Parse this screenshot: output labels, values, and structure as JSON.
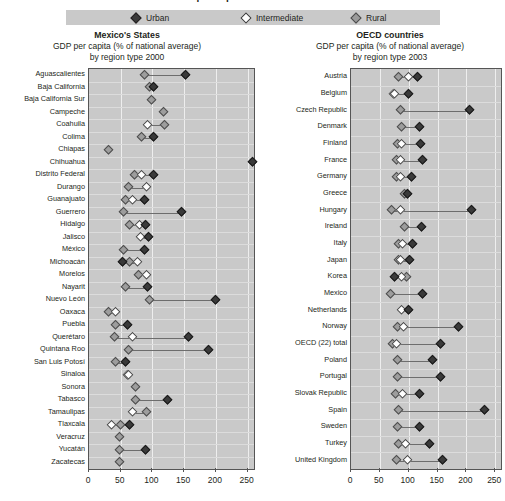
{
  "title": "GDP per capita in Mexico's States",
  "legend": {
    "urban": {
      "label": "Urban",
      "icon": "filled-diamond-icon",
      "color": "#3b3b3b"
    },
    "intermediate": {
      "label": "Intermediate",
      "icon": "open-diamond-icon",
      "color": "#ffffff"
    },
    "rural": {
      "label": "Rural",
      "icon": "grey-diamond-icon",
      "color": "#9a9a9a"
    }
  },
  "panels": {
    "left": {
      "title": "Mexico's States",
      "subtitle1": "GDP per capita (% of national average)",
      "subtitle2": "by region type 2000"
    },
    "right": {
      "title": "OECD countries",
      "subtitle1": "GDP per capita (% of national average)",
      "subtitle2": "by region type 2003"
    }
  },
  "chart_data": [
    {
      "type": "scatter",
      "title": "Mexico's States",
      "subtitle": "GDP per capita (% of national average) by region type 2000",
      "xlabel": "",
      "ylabel": "",
      "xlim": [
        0,
        260
      ],
      "xticks": [
        0,
        50,
        100,
        150,
        200,
        250
      ],
      "xticklabels": [
        "0",
        "50",
        "100",
        "150",
        "200",
        "250"
      ],
      "grid": true,
      "legend_position": "top",
      "series_names": [
        "Urban",
        "Intermediate",
        "Rural"
      ],
      "categories": [
        "Aguascalientes",
        "Baja California",
        "Baja California Sur",
        "Campeche",
        "Coahuila",
        "Colima",
        "Chiapas",
        "Chihuahua",
        "Distrito Federal",
        "Durango",
        "Guanajuato",
        "Guerrero",
        "Hidalgo",
        "Jalisco",
        "México",
        "Michoacán",
        "Morelos",
        "Nayarit",
        "Nuevo León",
        "Oaxaca",
        "Puebla",
        "Querétaro",
        "Quintana Roo",
        "San Luis Potosí",
        "Sinaloa",
        "Sonora",
        "Tabasco",
        "Tamaulipas",
        "Tlaxcala",
        "Veracruz",
        "Yucatán",
        "Zacatecas"
      ],
      "points": [
        {
          "category": "Aguascalientes",
          "urban": 152,
          "intermediate": null,
          "rural": 88
        },
        {
          "category": "Baja California",
          "urban": 101,
          "intermediate": null,
          "rural": 96
        },
        {
          "category": "Baja California Sur",
          "urban": null,
          "intermediate": null,
          "rural": 98
        },
        {
          "category": "Campeche",
          "urban": null,
          "intermediate": null,
          "rural": 118
        },
        {
          "category": "Coahuila",
          "urban": null,
          "intermediate": 92,
          "rural": 119
        },
        {
          "category": "Colima",
          "urban": 101,
          "intermediate": null,
          "rural": 83
        },
        {
          "category": "Chiapas",
          "urban": null,
          "intermediate": null,
          "rural": 31
        },
        {
          "category": "Chihuahua",
          "urban": 258,
          "intermediate": null,
          "rural": null
        },
        {
          "category": "Distrito Federal",
          "urban": 101,
          "intermediate": 83,
          "rural": 72
        },
        {
          "category": "Durango",
          "urban": null,
          "intermediate": 90,
          "rural": 63
        },
        {
          "category": "Guanajuato",
          "urban": 88,
          "intermediate": 68,
          "rural": 57
        },
        {
          "category": "Guerrero",
          "urban": 146,
          "intermediate": null,
          "rural": 55
        },
        {
          "category": "Hidalgo",
          "urban": 89,
          "intermediate": 79,
          "rural": 64
        },
        {
          "category": "Jalisco",
          "urban": 94,
          "intermediate": 81,
          "rural": null
        },
        {
          "category": "México",
          "urban": 88,
          "intermediate": null,
          "rural": 55
        },
        {
          "category": "Michoacán",
          "urban": 52,
          "intermediate": 76,
          "rural": 64
        },
        {
          "category": "Morelos",
          "urban": null,
          "intermediate": 91,
          "rural": 78
        },
        {
          "category": "Nayarit",
          "urban": 92,
          "intermediate": null,
          "rural": 58
        },
        {
          "category": "Nuevo León",
          "urban": 199,
          "intermediate": null,
          "rural": 96
        },
        {
          "category": "Oaxaca",
          "urban": null,
          "intermediate": 41,
          "rural": 31
        },
        {
          "category": "Puebla",
          "urban": 61,
          "intermediate": null,
          "rural": 41
        },
        {
          "category": "Querétaro",
          "urban": 157,
          "intermediate": 69,
          "rural": 40
        },
        {
          "category": "Quintana Roo",
          "urban": 188,
          "intermediate": null,
          "rural": 62
        },
        {
          "category": "San Luis Potosí",
          "urban": 57,
          "intermediate": null,
          "rural": 41
        },
        {
          "category": "Sinaloa",
          "urban": null,
          "intermediate": 62,
          "rural": 60
        },
        {
          "category": "Sonora",
          "urban": null,
          "intermediate": null,
          "rural": 73
        },
        {
          "category": "Tabasco",
          "urban": 124,
          "intermediate": null,
          "rural": 73
        },
        {
          "category": "Tamaulipas",
          "urban": null,
          "intermediate": 69,
          "rural": 90
        },
        {
          "category": "Tlaxcala",
          "urban": 64,
          "intermediate": 36,
          "rural": 49
        },
        {
          "category": "Veracruz",
          "urban": null,
          "intermediate": null,
          "rural": 48
        },
        {
          "category": "Yucatán",
          "urban": 89,
          "intermediate": null,
          "rural": 48
        },
        {
          "category": "Zacatecas",
          "urban": null,
          "intermediate": null,
          "rural": 48
        }
      ]
    },
    {
      "type": "scatter",
      "title": "OECD countries",
      "subtitle": "GDP per capita (% of national average) by region type 2003",
      "xlabel": "",
      "ylabel": "",
      "xlim": [
        0,
        260
      ],
      "xticks": [
        0,
        50,
        100,
        150,
        200,
        250
      ],
      "xticklabels": [
        "0",
        "50",
        "100",
        "150",
        "200",
        "250"
      ],
      "grid": true,
      "legend_position": "top",
      "series_names": [
        "Urban",
        "Intermediate",
        "Rural"
      ],
      "categories": [
        "Austria",
        "Belgium",
        "Czech Republic",
        "Denmark",
        "Finland",
        "France",
        "Germany",
        "Greece",
        "Hungary",
        "Ireland",
        "Italy",
        "Japan",
        "Korea",
        "Mexico",
        "Netherlands",
        "Norway",
        "OECD (22) total",
        "Poland",
        "Portugal",
        "Slovak Republic",
        "Spain",
        "Sweden",
        "Turkey",
        "United Kingdom"
      ],
      "points": [
        {
          "category": "Austria",
          "urban": 115,
          "intermediate": 100,
          "rural": 82
        },
        {
          "category": "Belgium",
          "urban": 100,
          "intermediate": 75,
          "rural": 73
        },
        {
          "category": "Czech Republic",
          "urban": 206,
          "intermediate": null,
          "rural": 85
        },
        {
          "category": "Denmark",
          "urban": 118,
          "intermediate": null,
          "rural": 88
        },
        {
          "category": "Finland",
          "urban": 121,
          "intermediate": 88,
          "rural": 80
        },
        {
          "category": "France",
          "urban": 124,
          "intermediate": 86,
          "rural": 78
        },
        {
          "category": "Germany",
          "urban": 105,
          "intermediate": 85,
          "rural": 78
        },
        {
          "category": "Greece",
          "urban": 98,
          "intermediate": null,
          "rural": 92
        },
        {
          "category": "Hungary",
          "urban": 208,
          "intermediate": 85,
          "rural": 70
        },
        {
          "category": "Ireland",
          "urban": 122,
          "intermediate": null,
          "rural": 93
        },
        {
          "category": "Italy",
          "urban": 106,
          "intermediate": 90,
          "rural": 82
        },
        {
          "category": "Japan",
          "urban": 102,
          "intermediate": 85,
          "rural": 82
        },
        {
          "category": "Korea",
          "urban": 76,
          "intermediate": 88,
          "rural": 96
        },
        {
          "category": "Mexico",
          "urban": 124,
          "intermediate": null,
          "rural": 68
        },
        {
          "category": "Netherlands",
          "urban": 99,
          "intermediate": 88,
          "rural": null
        },
        {
          "category": "Norway",
          "urban": 187,
          "intermediate": 91,
          "rural": 80
        },
        {
          "category": "OECD (22) total",
          "urban": 155,
          "intermediate": 78,
          "rural": 72
        },
        {
          "category": "Poland",
          "urban": 141,
          "intermediate": null,
          "rural": 80
        },
        {
          "category": "Portugal",
          "urban": 155,
          "intermediate": null,
          "rural": 81
        },
        {
          "category": "Slovak Republic",
          "urban": 119,
          "intermediate": 89,
          "rural": 77
        },
        {
          "category": "Spain",
          "urban": 232,
          "intermediate": null,
          "rural": 82
        },
        {
          "category": "Sweden",
          "urban": 118,
          "intermediate": null,
          "rural": 80
        },
        {
          "category": "Turkey",
          "urban": 136,
          "intermediate": 95,
          "rural": 83
        },
        {
          "category": "United Kingdom",
          "urban": 158,
          "intermediate": 98,
          "rural": 78
        }
      ]
    }
  ]
}
